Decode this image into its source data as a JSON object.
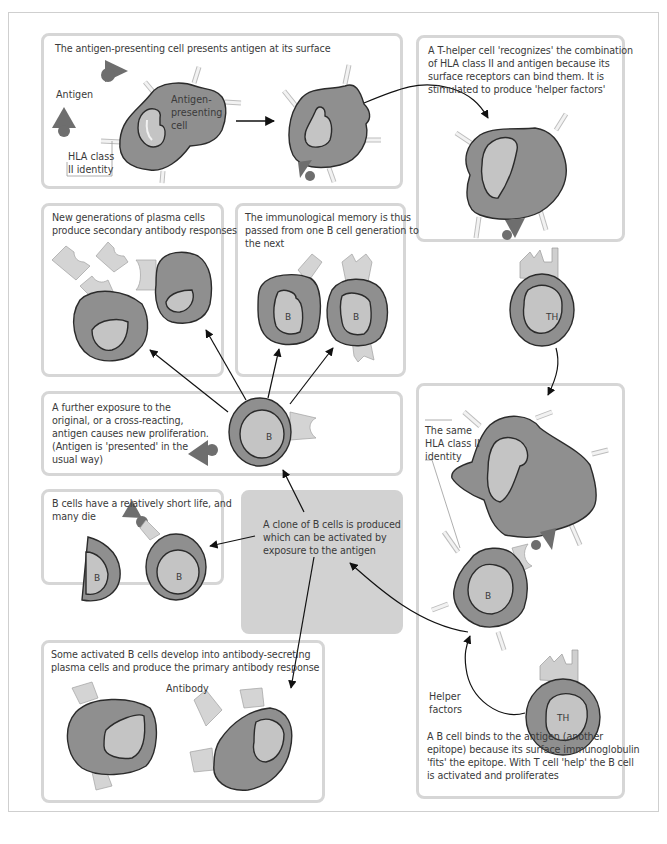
{
  "figure": {
    "topic": "B cell activation, clonal proliferation and immunological memory",
    "colors": {
      "cell_body": "#8f8f8f",
      "cell_nucleus": "#bdbdbd",
      "antigen": "#6e6e6e",
      "receptor": "#e4e4e4",
      "panel_border": "#d6d6d6",
      "shaded_panel": "#d2d2d2",
      "outline": "#2b2b2b"
    }
  },
  "panels": {
    "antigen_presenting": {
      "caption": "The antigen-presenting cell presents antigen at its surface",
      "labels": {
        "antigen": "Antigen",
        "apc_line1": "Antigen-",
        "apc_line2": "presenting",
        "apc_line3": "cell",
        "hla_line1": "HLA class",
        "hla_line2": "II identity"
      }
    },
    "t_helper": {
      "caption_lines": [
        "A T-helper cell 'recognizes' the combination",
        "of HLA class II and antigen because its",
        "surface receptors can bind them. It is",
        "stimulated to produce 'helper factors'"
      ],
      "cell_label": "TH"
    },
    "plasma_secondary": {
      "caption_lines": [
        "New generations of plasma cells",
        "produce secondary antibody responses"
      ]
    },
    "memory": {
      "caption_lines": [
        "The immunological memory is thus",
        "passed from one B cell generation to",
        "the next"
      ],
      "cell_labels": [
        "B",
        "B"
      ]
    },
    "further_exposure": {
      "caption_lines": [
        "A further exposure to the",
        "original, or a cross-reacting,",
        "antigen causes new proliferation.",
        "(Antigen is 'presented' in the",
        "usual way)"
      ],
      "cell_label": "B"
    },
    "short_life": {
      "caption_lines": [
        "B cells have a relatively short life, and",
        "many die"
      ],
      "cell_labels": [
        "B",
        "B"
      ]
    },
    "clone": {
      "caption_lines": [
        "A clone of B cells is produced",
        "which can be activated by",
        "exposure to the antigen"
      ]
    },
    "primary_response": {
      "caption_lines": [
        "Some activated B cells develop into antibody-secreting",
        "plasma cells and produce the primary antibody response"
      ],
      "antibody_label": "Antibody"
    },
    "b_cell_binding": {
      "hla_label_lines": [
        "The same",
        "HLA class II",
        "identity"
      ],
      "b_label": "B",
      "th_label": "TH",
      "helper_label_lines": [
        "Helper",
        "factors"
      ],
      "caption_lines": [
        "A B cell binds to the antigen (another",
        "epitope) because its surface immunoglobulin",
        "'fits' the epitope. With T cell 'help' the B cell",
        "is activated and proliferates"
      ]
    }
  }
}
